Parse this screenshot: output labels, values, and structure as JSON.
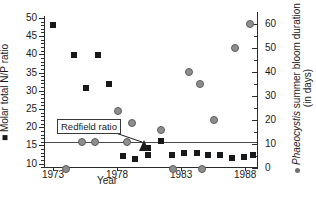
{
  "chart_data": {
    "type": "scatter",
    "title": "",
    "xlabel": "Year",
    "ylabel": "Molar total N/P ratio",
    "y2label": "Phaeocystis summer bloom duration (in days)",
    "y2label_part1": "Phaeocystis",
    "y2label_part2": " summer bloom duration",
    "y2label_part3": "(in days)",
    "xlim": [
      1972.3,
      1989.0
    ],
    "ylim": [
      8.8,
      50.5
    ],
    "y2lim": [
      0,
      63.2
    ],
    "grid": false,
    "legend_position": "axis-labels",
    "x_ticks": [
      1973,
      1978,
      1983,
      1988
    ],
    "x_tick_labels": [
      "1973",
      "1978",
      "1983",
      "1988"
    ],
    "y_ticks": [
      10,
      15,
      20,
      25,
      30,
      35,
      40,
      45,
      50
    ],
    "y_tick_labels": [
      "10",
      "15",
      "20",
      "25",
      "30",
      "35",
      "40",
      "45",
      "50"
    ],
    "y_minor_step": 1,
    "y2_ticks": [
      0,
      10,
      20,
      30,
      40,
      50,
      60
    ],
    "y2_tick_labels": [
      "0",
      "10",
      "20",
      "30",
      "40",
      "50",
      "60"
    ],
    "y2_minor_step": 5,
    "reference_line": {
      "label": "Redfield ratio",
      "value": 16,
      "axis": "left",
      "color": "#4a4a4a"
    },
    "series": [
      {
        "name": "Molar total N/P ratio",
        "marker": "filled-square",
        "color": "#17181a",
        "axis": "left",
        "points": [
          {
            "x": 1973.0,
            "y": 48.0
          },
          {
            "x": 1974.6,
            "y": 39.7
          },
          {
            "x": 1976.5,
            "y": 39.7
          },
          {
            "x": 1975.6,
            "y": 30.8
          },
          {
            "x": 1977.4,
            "y": 31.8
          },
          {
            "x": 1978.5,
            "y": 12.1
          },
          {
            "x": 1979.4,
            "y": 11.4
          },
          {
            "x": 1980.4,
            "y": 14.2
          },
          {
            "x": 1980.4,
            "y": 12.4
          },
          {
            "x": 1981.4,
            "y": 16.1
          },
          {
            "x": 1982.3,
            "y": 12.3
          },
          {
            "x": 1983.2,
            "y": 12.9
          },
          {
            "x": 1984.2,
            "y": 12.9
          },
          {
            "x": 1985.1,
            "y": 12.3
          },
          {
            "x": 1986.0,
            "y": 12.4
          },
          {
            "x": 1987.0,
            "y": 11.5
          },
          {
            "x": 1987.9,
            "y": 11.9
          },
          {
            "x": 1988.6,
            "y": 12.3
          }
        ]
      },
      {
        "name": "Phaeocystis summer bloom duration",
        "marker": "filled-circle",
        "color": "#8e8e8e",
        "axis": "right",
        "points": [
          {
            "x": 1974.0,
            "y": 0
          },
          {
            "x": 1975.2,
            "y": 11
          },
          {
            "x": 1976.2,
            "y": 11
          },
          {
            "x": 1978.0,
            "y": 24
          },
          {
            "x": 1978.7,
            "y": 11
          },
          {
            "x": 1979.1,
            "y": 19
          },
          {
            "x": 1981.4,
            "y": 16
          },
          {
            "x": 1982.3,
            "y": 0
          },
          {
            "x": 1983.6,
            "y": 40
          },
          {
            "x": 1984.4,
            "y": 35
          },
          {
            "x": 1984.6,
            "y": 0
          },
          {
            "x": 1985.5,
            "y": 20
          },
          {
            "x": 1987.2,
            "y": 50
          },
          {
            "x": 1988.3,
            "y": 60
          }
        ]
      }
    ]
  },
  "annotation": {
    "redfield_label": "Redfield ratio"
  }
}
